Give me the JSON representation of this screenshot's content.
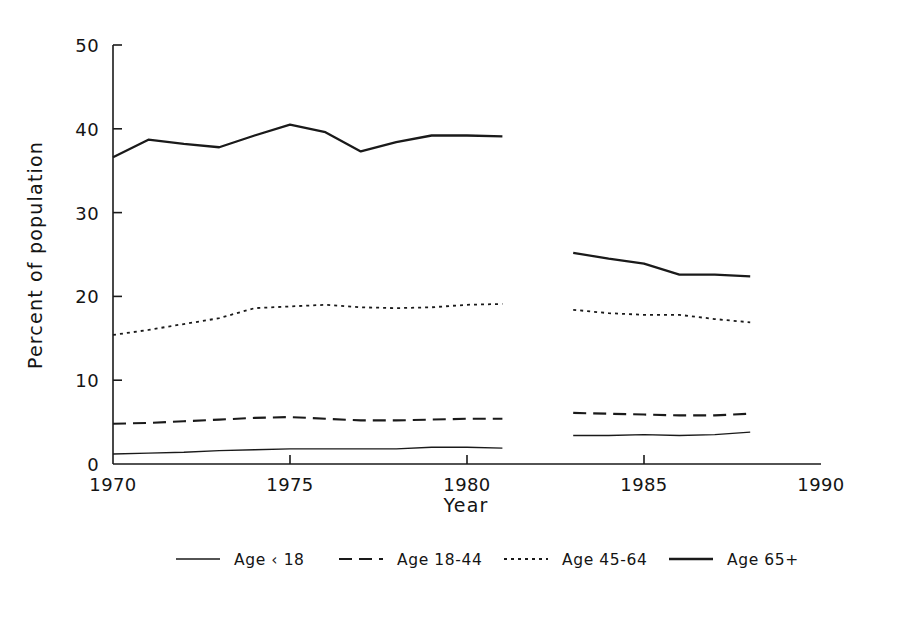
{
  "chart_data": {
    "type": "line",
    "title": "",
    "xlabel": "Year",
    "ylabel": "Percent of population",
    "xlim": [
      1970,
      1990
    ],
    "ylim": [
      0,
      50
    ],
    "xticks": [
      1970,
      1975,
      1980,
      1985,
      1990
    ],
    "xticklabels": [
      "1970",
      "1975",
      "1980",
      "1985",
      "1990"
    ],
    "yticks": [
      0,
      10,
      20,
      30,
      40,
      50
    ],
    "yticklabels": [
      "0",
      "10",
      "20",
      "30",
      "40",
      "50"
    ],
    "grid": false,
    "legend_position": "bottom",
    "gap_note": "Data break between 1981 and 1983",
    "series": [
      {
        "name": "Age < 18",
        "style": "solid-thin",
        "x": [
          1970,
          1971,
          1972,
          1973,
          1974,
          1975,
          1976,
          1977,
          1978,
          1979,
          1980,
          1981
        ],
        "values": [
          1.2,
          1.3,
          1.4,
          1.6,
          1.7,
          1.8,
          1.8,
          1.8,
          1.8,
          2.0,
          2.0,
          1.9
        ],
        "x2": [
          1983,
          1984,
          1985,
          1986,
          1987,
          1988
        ],
        "values2": [
          3.4,
          3.4,
          3.5,
          3.4,
          3.5,
          3.8
        ]
      },
      {
        "name": "Age 18-44",
        "style": "dashed",
        "x": [
          1970,
          1971,
          1972,
          1973,
          1974,
          1975,
          1976,
          1977,
          1978,
          1979,
          1980,
          1981
        ],
        "values": [
          4.8,
          4.9,
          5.1,
          5.3,
          5.5,
          5.6,
          5.4,
          5.2,
          5.2,
          5.3,
          5.4,
          5.4
        ],
        "x2": [
          1983,
          1984,
          1985,
          1986,
          1987,
          1988
        ],
        "values2": [
          6.1,
          6.0,
          5.9,
          5.8,
          5.8,
          6.0
        ]
      },
      {
        "name": "Age 45-64",
        "style": "dotted",
        "x": [
          1970,
          1971,
          1972,
          1973,
          1974,
          1975,
          1976,
          1977,
          1978,
          1979,
          1980,
          1981
        ],
        "values": [
          15.4,
          16.0,
          16.7,
          17.4,
          18.6,
          18.8,
          19.0,
          18.7,
          18.6,
          18.7,
          19.0,
          19.1
        ],
        "x2": [
          1983,
          1984,
          1985,
          1986,
          1987,
          1988
        ],
        "values2": [
          18.4,
          18.0,
          17.8,
          17.8,
          17.3,
          16.9
        ]
      },
      {
        "name": "Age 65+",
        "style": "solid-thick",
        "x": [
          1970,
          1971,
          1972,
          1973,
          1974,
          1975,
          1976,
          1977,
          1978,
          1979,
          1980,
          1981
        ],
        "values": [
          36.6,
          38.7,
          38.2,
          37.8,
          39.2,
          40.5,
          39.6,
          37.3,
          38.4,
          39.2,
          39.2,
          39.1
        ],
        "x2": [
          1983,
          1984,
          1985,
          1986,
          1987,
          1988
        ],
        "values2": [
          25.2,
          24.5,
          23.9,
          22.6,
          22.6,
          22.4
        ]
      }
    ]
  },
  "axes": {
    "x_title": "Year",
    "y_title": "Percent of population"
  },
  "ticks": {
    "x": [
      "1970",
      "1975",
      "1980",
      "1985",
      "1990"
    ],
    "y": [
      "0",
      "10",
      "20",
      "30",
      "40",
      "50"
    ]
  },
  "legend": {
    "entries": [
      {
        "label": "Age ‹ 18",
        "style": "solid-thin"
      },
      {
        "label": "Age 18-44",
        "style": "dashed"
      },
      {
        "label": "Age 45-64",
        "style": "dotted"
      },
      {
        "label": "Age 65+",
        "style": "solid-thick"
      }
    ]
  },
  "colors": {
    "line": "#1a1a1a",
    "axis": "#1a1a1a",
    "background": "#ffffff"
  }
}
